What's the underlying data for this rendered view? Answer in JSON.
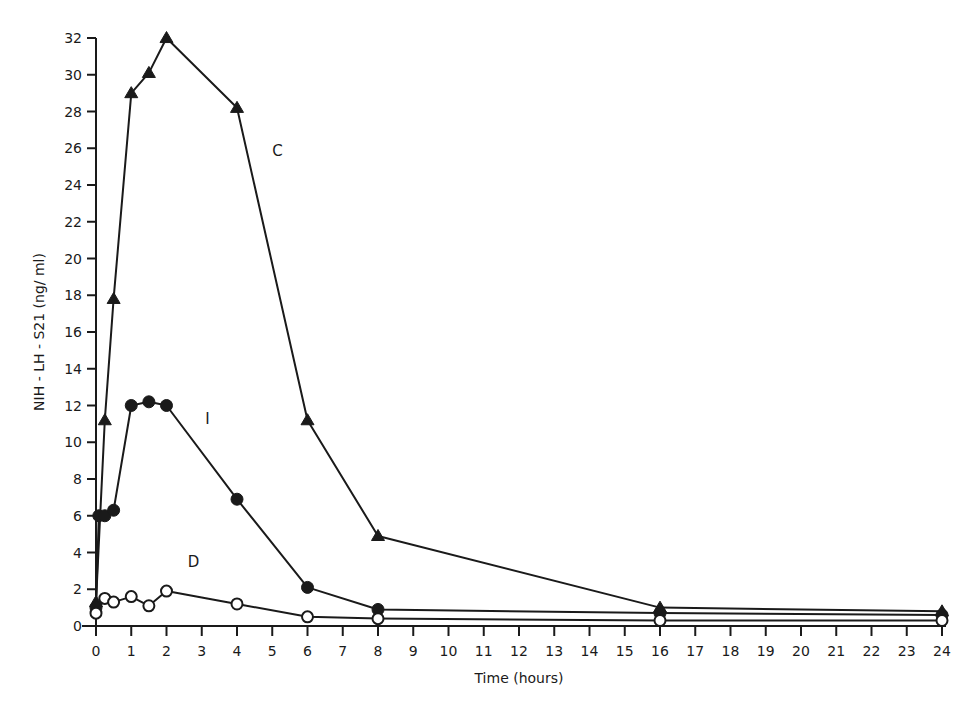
{
  "chart_data": {
    "type": "line",
    "title": "",
    "xlabel": "Time (hours)",
    "ylabel": "NIH - LH - S21 (ng/ ml)",
    "xlim": [
      0,
      24
    ],
    "ylim": [
      0,
      32
    ],
    "grid": false,
    "legend": "inline labels",
    "x_ticks": [
      0,
      1,
      2,
      3,
      4,
      5,
      6,
      7,
      8,
      9,
      10,
      11,
      12,
      13,
      14,
      15,
      16,
      17,
      18,
      19,
      20,
      21,
      22,
      23,
      24
    ],
    "y_ticks": [
      0,
      2,
      4,
      6,
      8,
      10,
      12,
      14,
      16,
      18,
      20,
      22,
      24,
      26,
      28,
      30,
      32
    ],
    "series": [
      {
        "name": "C",
        "marker": "filled-triangle",
        "label_pos": {
          "x": 5.0,
          "y": 25.6
        },
        "x": [
          0,
          0.25,
          0.5,
          1,
          1.5,
          2,
          4,
          6,
          8,
          16,
          24
        ],
        "values": [
          1.3,
          11.2,
          17.8,
          29.0,
          30.1,
          32.0,
          28.2,
          11.2,
          4.9,
          1.0,
          0.8
        ]
      },
      {
        "name": "I",
        "marker": "filled-circle",
        "label_pos": {
          "x": 3.1,
          "y": 11.0
        },
        "x": [
          0,
          0.08,
          0.25,
          0.5,
          1,
          1.5,
          2,
          4,
          6,
          8,
          16,
          24
        ],
        "values": [
          1.0,
          6.0,
          6.0,
          6.3,
          12.0,
          12.2,
          12.0,
          6.9,
          2.1,
          0.9,
          0.7,
          0.6
        ]
      },
      {
        "name": "D",
        "marker": "open-circle",
        "label_pos": {
          "x": 2.6,
          "y": 3.2
        },
        "x": [
          0,
          0.25,
          0.5,
          1,
          1.5,
          2,
          4,
          6,
          8,
          16,
          24
        ],
        "values": [
          0.7,
          1.5,
          1.3,
          1.6,
          1.1,
          1.9,
          1.2,
          0.5,
          0.4,
          0.3,
          0.3
        ]
      }
    ]
  }
}
